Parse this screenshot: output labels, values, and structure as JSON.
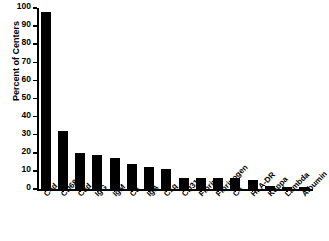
{
  "chart_data": {
    "type": "bar",
    "title": "",
    "xlabel": "",
    "ylabel": "Percent of Centers",
    "ylim": [
      0,
      100
    ],
    "yticks": [
      0,
      10,
      20,
      30,
      40,
      50,
      60,
      70,
      80,
      90,
      100
    ],
    "grid": false,
    "legend": null,
    "bar_color": "#000000",
    "categories": [
      "C4d",
      "CD68",
      "C3d",
      "IgG",
      "IgM",
      "C3",
      "IgA",
      "C1q",
      "CD31",
      "Fibrin",
      "Fibrinogen",
      "C4",
      "HLA-DR",
      "Kappa",
      "Lambda",
      "Albumin"
    ],
    "values": [
      98,
      32,
      20,
      19,
      17,
      14,
      12,
      11,
      6,
      6,
      6,
      6,
      5,
      1.5,
      1,
      1
    ]
  },
  "axis": {
    "y_title": "Percent of Centers"
  }
}
